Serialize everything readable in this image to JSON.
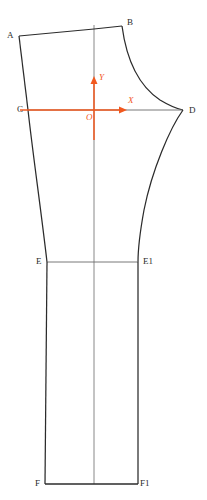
{
  "figure": {
    "background_color": "#ffffff",
    "outline_color": "#2b2b2b",
    "axis_color": "#f2581e",
    "construction_color": "#6a6a6a",
    "width": 207,
    "height": 500
  },
  "axes": {
    "origin_label": "O",
    "x_label": "X",
    "y_label": "Y",
    "origin": {
      "x": 94,
      "y": 110
    },
    "x_arrow_tip": {
      "x": 127,
      "y": 110
    },
    "y_arrow_tip": {
      "x": 94,
      "y": 76
    }
  },
  "points": [
    {
      "id": "A",
      "label": "A",
      "x": 19,
      "y": 36,
      "label_x": 7,
      "label_y": 31
    },
    {
      "id": "B",
      "label": "B",
      "x": 122,
      "y": 26,
      "label_x": 127,
      "label_y": 18
    },
    {
      "id": "C",
      "label": "C",
      "x": 28,
      "y": 110,
      "label_x": 17,
      "label_y": 105
    },
    {
      "id": "D",
      "label": "D",
      "x": 183,
      "y": 110,
      "label_x": 189,
      "label_y": 106
    },
    {
      "id": "E",
      "label": "E",
      "x": 47,
      "y": 262,
      "label_x": 36,
      "label_y": 257
    },
    {
      "id": "E1",
      "label": "E1",
      "x": 138,
      "y": 262,
      "label_x": 143,
      "label_y": 257
    },
    {
      "id": "F",
      "label": "F",
      "x": 45,
      "y": 484,
      "label_x": 35,
      "label_y": 479
    },
    {
      "id": "F1",
      "label": "F1",
      "x": 138,
      "y": 484,
      "label_x": 140,
      "label_y": 479
    }
  ],
  "segments": [
    {
      "name": "waist-line-A-B",
      "from": "A",
      "to": "B",
      "kind": "line"
    },
    {
      "name": "side-seam-A-C",
      "from": "A",
      "to": "C",
      "kind": "line"
    },
    {
      "name": "crotch-curve-B-D",
      "from": "B",
      "to": "D",
      "kind": "curve"
    },
    {
      "name": "hip-line-C-D",
      "from": "C",
      "to": "D",
      "kind": "line"
    },
    {
      "name": "side-seam-C-E",
      "from": "C",
      "to": "E",
      "kind": "curve"
    },
    {
      "name": "inseam-curve-D-E1",
      "from": "D",
      "to": "E1",
      "kind": "curve"
    },
    {
      "name": "knee-line-E-E1",
      "from": "E",
      "to": "E1",
      "kind": "line"
    },
    {
      "name": "side-seam-E-F",
      "from": "E",
      "to": "F",
      "kind": "line"
    },
    {
      "name": "inseam-E1-F1",
      "from": "E1",
      "to": "F1",
      "kind": "line"
    },
    {
      "name": "hem-line-F-F1",
      "from": "F",
      "to": "F1",
      "kind": "line"
    },
    {
      "name": "grain-center-line",
      "from": "top",
      "to": "hem",
      "kind": "construction"
    }
  ]
}
